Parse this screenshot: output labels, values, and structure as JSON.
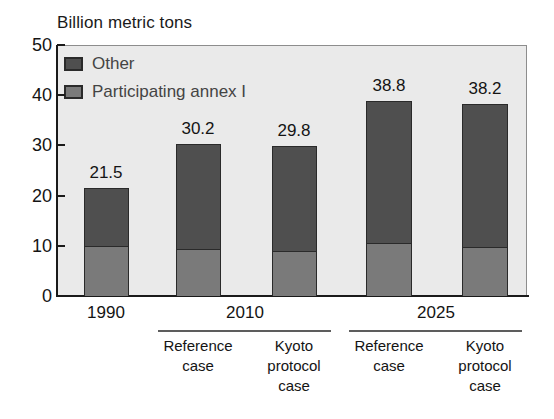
{
  "chart_data": {
    "type": "bar",
    "subtype": "stacked",
    "title": "Billion metric tons",
    "xlabel": "",
    "ylabel": "Billion metric tons",
    "ylim": [
      0,
      50
    ],
    "yticks": [
      0,
      10,
      20,
      30,
      40,
      50
    ],
    "grid": false,
    "legend_position": "top-left inside plot",
    "categories": [
      "1990",
      "2010 Reference case",
      "2010 Kyoto protocol case",
      "2025 Reference case",
      "2025 Kyoto protocol case"
    ],
    "series": [
      {
        "name": "Participating annex I",
        "color": "#7a7a7a",
        "values": [
          10.0,
          9.3,
          9.0,
          10.5,
          9.7
        ]
      },
      {
        "name": "Other",
        "color": "#4f4f4f",
        "values": [
          11.5,
          20.9,
          20.8,
          28.3,
          28.5
        ]
      }
    ],
    "totals": [
      21.5,
      30.2,
      29.8,
      38.8,
      38.2
    ],
    "data_labels": [
      "21.5",
      "30.2",
      "29.8",
      "38.8",
      "38.2"
    ]
  },
  "axis": {
    "y_tick_labels": [
      "50",
      "40",
      "30",
      "20",
      "10",
      "0"
    ],
    "y_tick_values": [
      50,
      40,
      30,
      20,
      10,
      0
    ]
  },
  "legend": {
    "items": [
      {
        "label": "Other",
        "swatch": "other"
      },
      {
        "label": "Participating annex I",
        "swatch": "annex"
      }
    ]
  },
  "bars": [
    {
      "id": "bar-1990",
      "total_label": "21.5",
      "total": 21.5,
      "annex": 10.0,
      "other": 11.5,
      "left": 84,
      "width": 45,
      "center": 106
    },
    {
      "id": "bar-2010-reference",
      "total_label": "30.2",
      "total": 30.2,
      "annex": 9.3,
      "other": 20.9,
      "left": 176,
      "width": 45,
      "center": 198
    },
    {
      "id": "bar-2010-kyoto",
      "total_label": "29.8",
      "total": 29.8,
      "annex": 9.0,
      "other": 20.8,
      "left": 272,
      "width": 45,
      "center": 294
    },
    {
      "id": "bar-2025-reference",
      "total_label": "38.8",
      "total": 38.8,
      "annex": 10.5,
      "other": 28.3,
      "left": 366,
      "width": 46,
      "center": 389
    },
    {
      "id": "bar-2025-kyoto",
      "total_label": "38.2",
      "total": 38.2,
      "annex": 9.7,
      "other": 28.5,
      "left": 462,
      "width": 46,
      "center": 485
    }
  ],
  "year_groups": [
    {
      "id": "group-1990",
      "label": "1990",
      "center": 106,
      "has_rule": false
    },
    {
      "id": "group-2010",
      "label": "2010",
      "center": 245,
      "has_rule": true,
      "rule_left": 158,
      "rule_width": 173
    },
    {
      "id": "group-2025",
      "label": "2025",
      "center": 436,
      "has_rule": true,
      "rule_left": 349,
      "rule_width": 173
    }
  ],
  "case_labels": [
    {
      "id": "case-2010-reference",
      "line1": "Reference",
      "line2": "case",
      "center": 198
    },
    {
      "id": "case-2010-kyoto",
      "line1": "Kyoto",
      "line2": "protocol",
      "line3": "case",
      "center": 294
    },
    {
      "id": "case-2025-reference",
      "line1": "Reference",
      "line2": "case",
      "center": 389
    },
    {
      "id": "case-2025-kyoto",
      "line1": "Kyoto",
      "line2": "protocol",
      "line3": "case",
      "center": 485
    }
  ],
  "colors": {
    "other": "#4f4f4f",
    "annex": "#7a7a7a",
    "plot_background": "#eaeaea",
    "axis": "#1a1a1a",
    "legend_text": "#444444"
  }
}
